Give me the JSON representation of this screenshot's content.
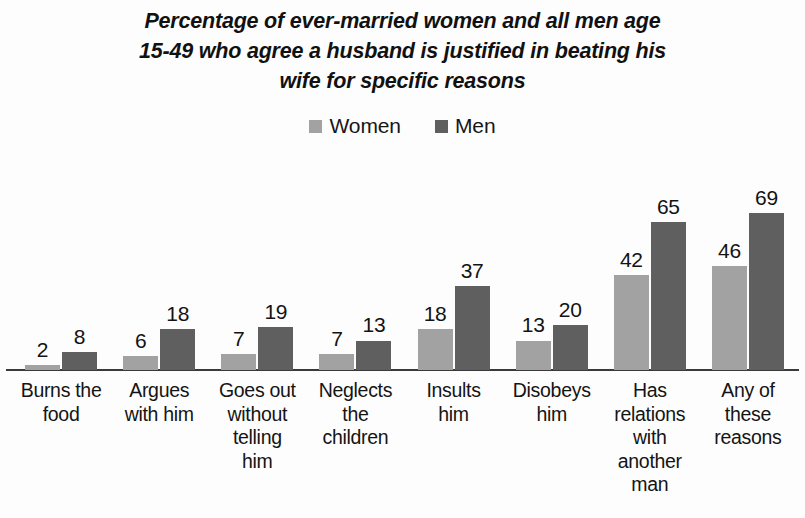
{
  "chart_data": {
    "type": "bar",
    "title": "Percentage of ever-married women and all men age 15-49 who agree a husband is justified in beating his wife for specific reasons",
    "title_lines": [
      "Percentage of ever-married women and all men age",
      "15-49 who agree a husband is justified in beating his",
      "wife for specific reasons"
    ],
    "xlabel": "",
    "ylabel": "",
    "ylim": [
      0,
      75
    ],
    "grid": false,
    "legend_position": "top-center",
    "categories": [
      "Burns the food",
      "Argues with him",
      "Goes out without telling him",
      "Neglects the children",
      "Insults him",
      "Disobeys him",
      "Has relations with another man",
      "Any of these reasons"
    ],
    "category_lines": [
      [
        "Burns the",
        "food"
      ],
      [
        "Argues",
        "with him"
      ],
      [
        "Goes out",
        "without",
        "telling",
        "him"
      ],
      [
        "Neglects",
        "the",
        "children"
      ],
      [
        "Insults",
        "him"
      ],
      [
        "Disobeys",
        "him"
      ],
      [
        "Has",
        "relations",
        "with",
        "another",
        "man"
      ],
      [
        "Any of",
        "these",
        "reasons"
      ]
    ],
    "series": [
      {
        "name": "Women",
        "color": "#a2a2a2",
        "values": [
          2,
          6,
          7,
          7,
          18,
          13,
          42,
          46
        ]
      },
      {
        "name": "Men",
        "color": "#5f5f5f",
        "values": [
          8,
          18,
          19,
          13,
          37,
          20,
          65,
          69
        ]
      }
    ]
  },
  "legend": {
    "entries": [
      {
        "label": "Women",
        "color": "#a2a2a2"
      },
      {
        "label": "Men",
        "color": "#5f5f5f"
      }
    ]
  }
}
